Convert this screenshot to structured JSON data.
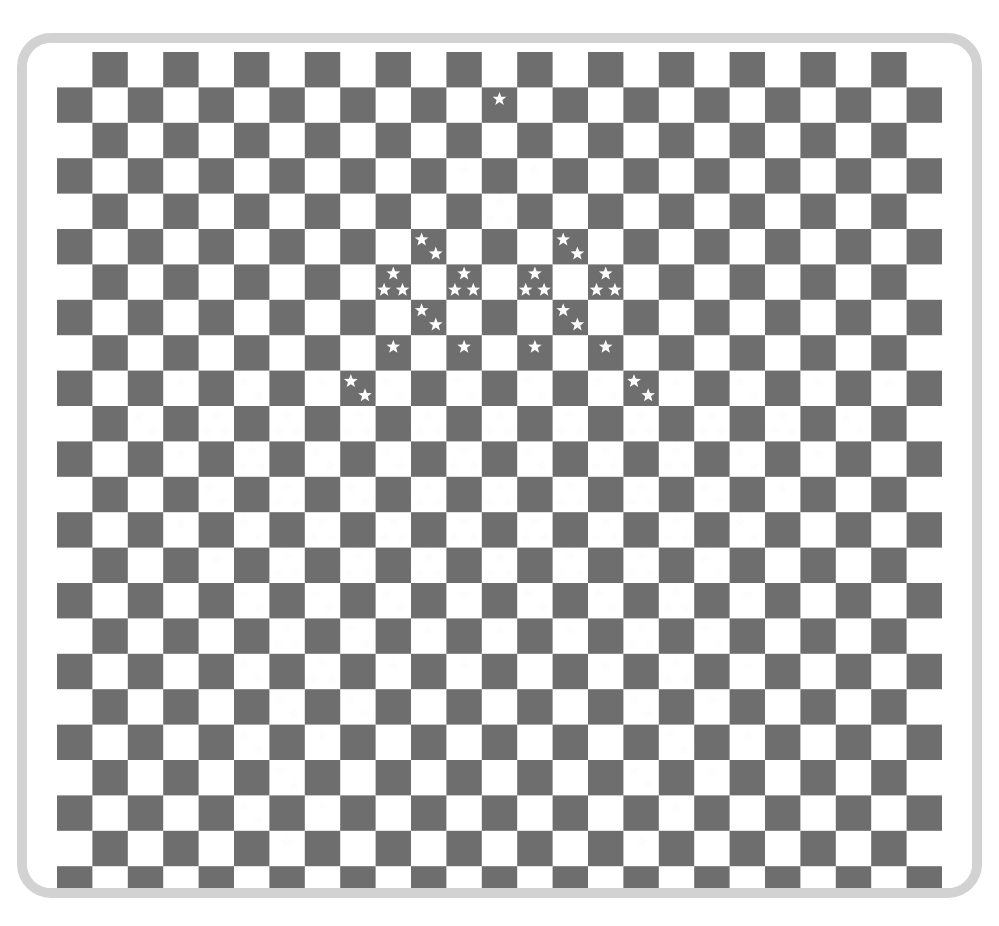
{
  "artwork": {
    "title": "Checkerboard with Fractal Star Arrangement",
    "caption": "",
    "canvas": {
      "width": 999,
      "height": 926
    },
    "colors": {
      "background": "#ffffff",
      "frame_border": "#d2d2d2",
      "matting": "#ffffff",
      "dark_square": "#6e6e6e",
      "light_square": "#fbfbfb",
      "star_fill": "#fdfdfd"
    },
    "frame": {
      "x": 17,
      "y": 33,
      "width": 965,
      "height": 865,
      "border_width": 10,
      "corner_radius": 34
    },
    "matting": {
      "x": 27,
      "y": 43,
      "width": 945,
      "height": 845,
      "corner_radius": 24
    },
    "grid": {
      "origin_x": 57,
      "origin_y": 52,
      "cell_size": 35.4,
      "columns": 25,
      "rows": 24,
      "parity_dark_offset": 1,
      "note": "dark square when (col + row) % 2 == 1"
    },
    "star_glyph": {
      "points": 5,
      "outer_radius": 1.0,
      "inner_ratio": 0.42,
      "rotation_deg": -90
    },
    "star_clusters": {
      "description": "Each entry is [column, row, count]; count 1..3 white stars placed inside that dark cell.",
      "cell_offsets": [
        [
          [
            0.5,
            0.33
          ]
        ],
        [
          [
            0.3,
            0.3
          ],
          [
            0.7,
            0.7
          ]
        ],
        [
          [
            0.5,
            0.26
          ],
          [
            0.24,
            0.72
          ],
          [
            0.76,
            0.72
          ]
        ]
      ],
      "star_radius_px": 7.2,
      "entries": [
        [
          12,
          1,
          1
        ],
        [
          11,
          3,
          1
        ],
        [
          13,
          3,
          1
        ],
        [
          12,
          4,
          3
        ],
        [
          10,
          5,
          2
        ],
        [
          14,
          5,
          2
        ],
        [
          9,
          6,
          3
        ],
        [
          11,
          6,
          3
        ],
        [
          13,
          6,
          3
        ],
        [
          15,
          6,
          3
        ],
        [
          10,
          7,
          2
        ],
        [
          14,
          7,
          2
        ],
        [
          9,
          8,
          1
        ],
        [
          11,
          8,
          1
        ],
        [
          13,
          8,
          1
        ],
        [
          15,
          8,
          1
        ],
        [
          8,
          9,
          2
        ],
        [
          16,
          9,
          2
        ],
        [
          3,
          9,
          1
        ],
        [
          5,
          9,
          2
        ],
        [
          7,
          9,
          1
        ],
        [
          9,
          9,
          2
        ],
        [
          11,
          9,
          2
        ],
        [
          13,
          9,
          2
        ],
        [
          15,
          9,
          2
        ],
        [
          17,
          9,
          1
        ],
        [
          19,
          9,
          2
        ],
        [
          21,
          9,
          1
        ],
        [
          23,
          9,
          1
        ],
        [
          2,
          10,
          2
        ],
        [
          4,
          10,
          3
        ],
        [
          6,
          10,
          3
        ],
        [
          8,
          10,
          3
        ],
        [
          10,
          10,
          3
        ],
        [
          12,
          10,
          3
        ],
        [
          14,
          10,
          3
        ],
        [
          16,
          10,
          3
        ],
        [
          18,
          10,
          3
        ],
        [
          20,
          10,
          3
        ],
        [
          22,
          10,
          2
        ],
        [
          3,
          11,
          1
        ],
        [
          5,
          11,
          3
        ],
        [
          7,
          11,
          2
        ],
        [
          9,
          11,
          2
        ],
        [
          11,
          11,
          3
        ],
        [
          13,
          11,
          2
        ],
        [
          15,
          11,
          3
        ],
        [
          17,
          11,
          3
        ],
        [
          19,
          11,
          2
        ],
        [
          21,
          11,
          1
        ],
        [
          4,
          12,
          2
        ],
        [
          6,
          12,
          3
        ],
        [
          8,
          12,
          2
        ],
        [
          10,
          12,
          3
        ],
        [
          12,
          12,
          3
        ],
        [
          14,
          12,
          3
        ],
        [
          16,
          12,
          3
        ],
        [
          18,
          12,
          2
        ],
        [
          20,
          12,
          1
        ],
        [
          3,
          13,
          1
        ],
        [
          5,
          13,
          2
        ],
        [
          7,
          13,
          3
        ],
        [
          9,
          13,
          3
        ],
        [
          11,
          13,
          3
        ],
        [
          13,
          13,
          3
        ],
        [
          15,
          13,
          3
        ],
        [
          17,
          13,
          3
        ],
        [
          19,
          13,
          2
        ],
        [
          4,
          14,
          1
        ],
        [
          6,
          14,
          3
        ],
        [
          8,
          14,
          3
        ],
        [
          10,
          14,
          3
        ],
        [
          12,
          14,
          3
        ],
        [
          14,
          14,
          3
        ],
        [
          16,
          14,
          3
        ],
        [
          18,
          14,
          2
        ],
        [
          5,
          15,
          2
        ],
        [
          7,
          15,
          2
        ],
        [
          9,
          15,
          2
        ],
        [
          11,
          15,
          1
        ],
        [
          13,
          15,
          2
        ],
        [
          15,
          15,
          2
        ],
        [
          17,
          15,
          3
        ],
        [
          19,
          15,
          1
        ],
        [
          6,
          16,
          3
        ],
        [
          8,
          16,
          2
        ],
        [
          10,
          16,
          1
        ],
        [
          12,
          16,
          1
        ],
        [
          14,
          16,
          1
        ],
        [
          16,
          16,
          3
        ],
        [
          18,
          16,
          2
        ],
        [
          5,
          17,
          2
        ],
        [
          7,
          17,
          3
        ],
        [
          9,
          17,
          1
        ],
        [
          11,
          17,
          1
        ],
        [
          15,
          17,
          1
        ],
        [
          17,
          17,
          3
        ],
        [
          19,
          17,
          1
        ],
        [
          6,
          18,
          2
        ],
        [
          8,
          18,
          2
        ],
        [
          16,
          18,
          2
        ],
        [
          18,
          18,
          1
        ],
        [
          5,
          19,
          2
        ],
        [
          7,
          19,
          1
        ],
        [
          17,
          19,
          2
        ],
        [
          19,
          19,
          1
        ],
        [
          6,
          20,
          2
        ],
        [
          16,
          20,
          2
        ],
        [
          18,
          20,
          1
        ],
        [
          5,
          21,
          2
        ],
        [
          7,
          21,
          1
        ],
        [
          17,
          21,
          1
        ],
        [
          6,
          22,
          1
        ],
        [
          16,
          22,
          1
        ]
      ]
    }
  }
}
